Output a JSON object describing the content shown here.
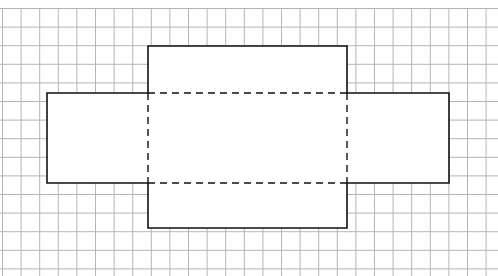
{
  "diagram": {
    "type": "net of rectangular prism on grid paper",
    "grid": {
      "x0": 2.5,
      "y0": 8.5,
      "step": 18.6,
      "cols": 27,
      "rows": 15,
      "color": "#b5b5b5"
    },
    "outline_color": "#111111",
    "shapes": {
      "top_face": {
        "x": 148,
        "y": 46,
        "w": 199,
        "h": 47
      },
      "left_face": {
        "x": 47,
        "y": 93,
        "w": 101,
        "h": 90
      },
      "center_face": {
        "x": 148,
        "y": 93,
        "w": 199,
        "h": 90
      },
      "right_face": {
        "x": 347,
        "y": 93,
        "w": 102,
        "h": 90
      },
      "bottom_face": {
        "x": 148,
        "y": 183,
        "w": 199,
        "h": 45
      }
    },
    "fold_lines": "dashed"
  }
}
